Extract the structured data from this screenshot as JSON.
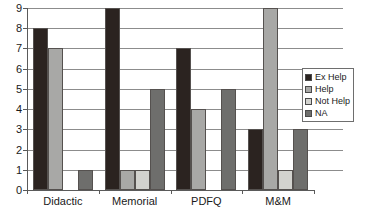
{
  "chart_data": {
    "type": "bar",
    "title": "",
    "xlabel": "",
    "ylabel": "",
    "categories": [
      "Didactic",
      "Memorial",
      "PDFQ",
      "M&M"
    ],
    "ylim": [
      0,
      9
    ],
    "yticks": [
      0,
      1,
      2,
      3,
      4,
      5,
      6,
      7,
      8,
      9
    ],
    "ytick_labels": [
      "0",
      "1",
      "2",
      "3",
      "4",
      "5",
      "6",
      "7",
      "8",
      "9"
    ],
    "grid": true,
    "legend_position": "right",
    "series": [
      {
        "name": "Ex Help",
        "color": "#2b2320",
        "values": [
          8,
          9,
          7,
          3
        ]
      },
      {
        "name": "Help",
        "color": "#a8a8a6",
        "values": [
          7,
          1,
          4,
          9
        ]
      },
      {
        "name": "Not Help",
        "color": "#d2d2ce",
        "values": [
          0,
          1,
          0,
          1
        ]
      },
      {
        "name": "NA",
        "color": "#6e6e6c",
        "values": [
          1,
          5,
          5,
          3
        ]
      }
    ]
  },
  "legend": {
    "items": [
      {
        "label": "Ex Help",
        "color": "#2b2320"
      },
      {
        "label": "Help",
        "color": "#a8a8a6"
      },
      {
        "label": "Not Help",
        "color": "#d2d2ce"
      },
      {
        "label": "NA",
        "color": "#6e6e6c"
      }
    ]
  }
}
